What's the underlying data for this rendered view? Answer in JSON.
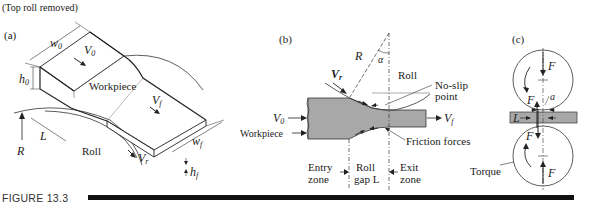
{
  "header_note": "(Top roll removed)",
  "figure": {
    "caption_label": "FIGURE 13.3",
    "colors": {
      "workpiece_fill": "#a8a8a8",
      "line": "#222222",
      "caption_bar": "#111111"
    }
  },
  "panel_a": {
    "label": "(a)",
    "labels": {
      "w0": "w",
      "w0_sub": "0",
      "V0": "V",
      "V0_sub": "0",
      "h0": "h",
      "h0_sub": "0",
      "workpiece": "Workpiece",
      "Vf": "V",
      "Vf_sub": "f",
      "L": "L",
      "R": "R",
      "roll": "Roll",
      "Vr": "V",
      "Vr_sub": "r",
      "wf": "w",
      "wf_sub": "f",
      "hf": "h",
      "hf_sub": "f"
    }
  },
  "panel_b": {
    "label": "(b)",
    "labels": {
      "R": "R",
      "alpha": "α",
      "Vr": "V",
      "Vr_sub": "r",
      "roll": "Roll",
      "no_slip_1": "No-slip",
      "no_slip_2": "point",
      "V0": "V",
      "V0_sub": "0",
      "Vf": "V",
      "Vf_sub": "f",
      "workpiece": "Workpiece",
      "friction": "Friction forces",
      "entry_1": "Entry",
      "entry_2": "zone",
      "gap_1": "Roll",
      "gap_2": "gap L",
      "exit_1": "Exit",
      "exit_2": "zone"
    }
  },
  "panel_c": {
    "label": "(c)",
    "labels": {
      "F_top": "F",
      "F_left": "F",
      "a": "a",
      "L": "L",
      "F_lower_left": "F",
      "F_bottom": "F",
      "torque": "Torque"
    }
  }
}
